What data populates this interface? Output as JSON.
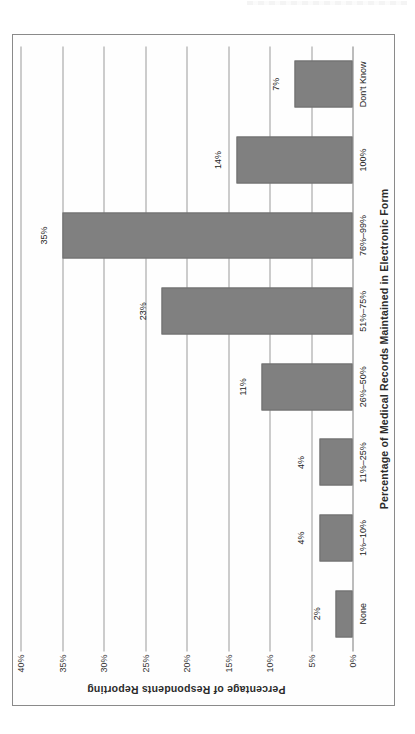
{
  "figure": {
    "background_color": "#fefefe",
    "frame_color": "#8a8a8a",
    "bar_color": "#808080",
    "gridline_color": "#9a9a9a"
  },
  "chart_data": {
    "type": "bar",
    "orientation": "vertical",
    "title": "",
    "xlabel": "Percentage of Medical Records Maintained in Electronic Form",
    "ylabel": "Percentage of Respondents Reporting",
    "categories": [
      "None",
      "1%–10%",
      "11%–25%",
      "26%–50%",
      "51%–75%",
      "76%–99%",
      "100%",
      "Don't Know"
    ],
    "values": [
      2,
      4,
      4,
      11,
      23,
      35,
      14,
      7
    ],
    "data_labels": [
      "2%",
      "4%",
      "4%",
      "11%",
      "23%",
      "35%",
      "14%",
      "7%"
    ],
    "ylim": [
      0,
      40
    ],
    "ytick_values": [
      0,
      5,
      10,
      15,
      20,
      25,
      30,
      35,
      40
    ],
    "ytick_labels": [
      "0%",
      "5%",
      "10%",
      "15%",
      "20%",
      "25%",
      "30%",
      "35%",
      "40%"
    ],
    "grid": true,
    "grid_axis": "y",
    "legend": false,
    "legend_position": "none",
    "series": [
      {
        "name": "Percentage of Respondents Reporting",
        "values": [
          2,
          4,
          4,
          11,
          23,
          35,
          14,
          7
        ],
        "color": "#808080"
      }
    ]
  }
}
